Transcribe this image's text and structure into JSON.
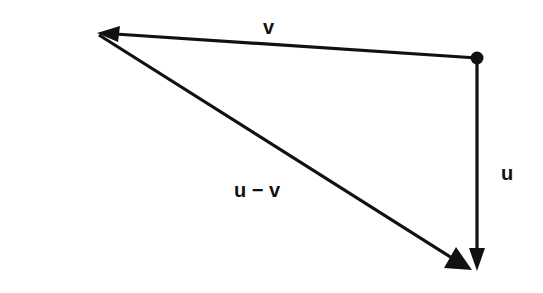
{
  "diagram": {
    "type": "vector-triangle",
    "labels": {
      "v": "v",
      "u": "u",
      "u_minus_v": "u − v"
    },
    "colors": {
      "stroke": "#111111",
      "background": "#ffffff"
    },
    "points": {
      "origin_dot": [
        477,
        58
      ],
      "v_tip": [
        97,
        33
      ],
      "u_tip": [
        477,
        271
      ]
    },
    "vectors": [
      {
        "name": "v",
        "from": "origin_dot",
        "to": "v_tip"
      },
      {
        "name": "u",
        "from": "origin_dot",
        "to": "u_tip"
      },
      {
        "name": "u − v",
        "from": "v_tip",
        "to": "u_tip"
      }
    ]
  }
}
